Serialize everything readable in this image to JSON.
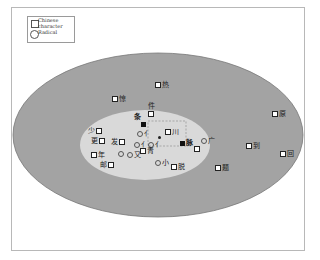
{
  "colors": {
    "outer_ellipse": "#a3a3a3",
    "inner_ellipse": "#d9d9d9",
    "frame_border": "#b8b8b8",
    "marker": "#222222"
  },
  "legend": {
    "items": [
      {
        "shape": "square",
        "label": "Chinese character"
      },
      {
        "shape": "circle",
        "label": "Radical"
      }
    ],
    "square_label_line1": "Chinese",
    "square_label_line2": "character",
    "circle_label": "Radical"
  },
  "regions": [
    {
      "name": "outer",
      "cx": 158,
      "cy": 135,
      "rx": 145,
      "ry": 82
    },
    {
      "name": "inner",
      "cx": 145,
      "cy": 145,
      "rx": 65,
      "ry": 35
    }
  ],
  "nodes": [
    {
      "id": "n1",
      "type": "character",
      "label": "热",
      "x": 158,
      "y": 85,
      "label_side": "right"
    },
    {
      "id": "n2",
      "type": "character",
      "label": "惊",
      "x": 115,
      "y": 99,
      "label_side": "right"
    },
    {
      "id": "n3",
      "type": "character",
      "label": "件",
      "x": 151,
      "y": 114,
      "label_side": "top"
    },
    {
      "id": "n4",
      "type": "character-filled",
      "label": "条",
      "x": 143,
      "y": 124,
      "label_side": "top-left"
    },
    {
      "id": "n5",
      "type": "character",
      "label": "少",
      "x": 99,
      "y": 131,
      "label_side": "left"
    },
    {
      "id": "n6",
      "type": "character",
      "label": "更",
      "x": 102,
      "y": 141,
      "label_side": "left"
    },
    {
      "id": "n7",
      "type": "character",
      "label": "发",
      "x": 122,
      "y": 142,
      "label_side": "left"
    },
    {
      "id": "n8",
      "type": "radical",
      "label": "亻",
      "x": 140,
      "y": 134,
      "label_side": "right"
    },
    {
      "id": "n9",
      "type": "radical",
      "label": "亻",
      "x": 137,
      "y": 145,
      "label_side": "right"
    },
    {
      "id": "n10",
      "type": "radical",
      "label": "亻",
      "x": 151,
      "y": 145,
      "label_side": "right"
    },
    {
      "id": "n11",
      "type": "dot",
      "label": "",
      "x": 159,
      "y": 137,
      "label_side": "none"
    },
    {
      "id": "n12",
      "type": "character",
      "label": "川",
      "x": 168,
      "y": 132,
      "label_side": "right"
    },
    {
      "id": "n13",
      "type": "character-filled",
      "label": "脉",
      "x": 182,
      "y": 143,
      "label_side": "right"
    },
    {
      "id": "n14",
      "type": "character",
      "label": "",
      "x": 197,
      "y": 149,
      "label_side": "none"
    },
    {
      "id": "n15",
      "type": "radical",
      "label": "广",
      "x": 204,
      "y": 141,
      "label_side": "right"
    },
    {
      "id": "n16",
      "type": "character",
      "label": "年",
      "x": 94,
      "y": 155,
      "label_side": "right"
    },
    {
      "id": "n17",
      "type": "radical",
      "label": "",
      "x": 121,
      "y": 154,
      "label_side": "none"
    },
    {
      "id": "n18",
      "type": "radical",
      "label": "又",
      "x": 130,
      "y": 155,
      "label_side": "right"
    },
    {
      "id": "n19",
      "type": "character",
      "label": "青",
      "x": 143,
      "y": 151,
      "label_side": "right"
    },
    {
      "id": "n20",
      "type": "character",
      "label": "邮",
      "x": 111,
      "y": 165,
      "label_side": "left"
    },
    {
      "id": "n21",
      "type": "radical",
      "label": "小",
      "x": 158,
      "y": 163,
      "label_side": "right"
    },
    {
      "id": "n22",
      "type": "character",
      "label": "脱",
      "x": 174,
      "y": 167,
      "label_side": "right"
    },
    {
      "id": "n23",
      "type": "character",
      "label": "题",
      "x": 218,
      "y": 168,
      "label_side": "right"
    },
    {
      "id": "n24",
      "type": "character",
      "label": "到",
      "x": 249,
      "y": 146,
      "label_side": "right"
    },
    {
      "id": "n25",
      "type": "character",
      "label": "原",
      "x": 275,
      "y": 114,
      "label_side": "right"
    },
    {
      "id": "n26",
      "type": "character",
      "label": "回",
      "x": 283,
      "y": 154,
      "label_side": "right"
    }
  ],
  "dashed_box": {
    "x1": 148,
    "y1": 121,
    "x2": 186,
    "y2": 146
  }
}
